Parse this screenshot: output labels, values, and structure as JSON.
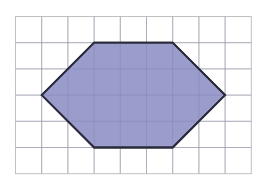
{
  "diagram": {
    "grid": {
      "columns": 9,
      "rows": 6,
      "origin_x": 15.5,
      "origin_y": 16.5,
      "cell_size": 26.2,
      "line_color": "#c8c8c8",
      "border_color": "#c0c0c0",
      "background": "#ffffff"
    },
    "shape": {
      "type": "hexagon",
      "vertices_grid": [
        [
          1,
          3
        ],
        [
          3,
          1
        ],
        [
          6,
          1
        ],
        [
          8,
          3
        ],
        [
          6,
          5
        ],
        [
          3,
          5
        ]
      ],
      "fill_color": "#9a9ccb",
      "stroke_color": "#2a2a3a",
      "stroke_width": 1.8
    }
  }
}
